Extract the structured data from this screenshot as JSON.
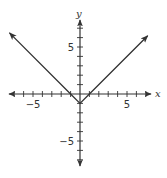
{
  "chart_data": {
    "type": "line",
    "title": "",
    "function": "y = |x| - 1",
    "xlabel": "x",
    "ylabel": "y",
    "xlim": [
      -8,
      7.5
    ],
    "ylim": [
      -7.5,
      8
    ],
    "x_tick_step": 1,
    "y_tick_step": 1,
    "x_tick_labels": [
      {
        "value": -5,
        "label": "−5"
      },
      {
        "value": 5,
        "label": "5"
      }
    ],
    "y_tick_labels": [
      {
        "value": 5,
        "label": "5"
      },
      {
        "value": -5,
        "label": "−5"
      }
    ],
    "grid": false,
    "series": [
      {
        "name": "y = |x| - 1",
        "x": [
          -7.5,
          -1,
          0,
          1,
          7.2
        ],
        "y": [
          6.5,
          0,
          -1,
          0,
          6.2
        ],
        "arrows_at_ends": true,
        "vertex": [
          0,
          -1
        ]
      }
    ],
    "colors": {
      "axis": "#333333",
      "line": "#333333"
    }
  }
}
